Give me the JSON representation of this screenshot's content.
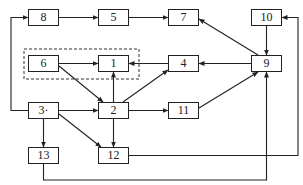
{
  "diagram": {
    "type": "directed-flow",
    "nodes": [
      {
        "id": "8",
        "label": "8",
        "x": 28,
        "y": 9,
        "w": 31,
        "h": 17
      },
      {
        "id": "5",
        "label": "5",
        "x": 98,
        "y": 9,
        "w": 31,
        "h": 17
      },
      {
        "id": "7",
        "label": "7",
        "x": 168,
        "y": 9,
        "w": 31,
        "h": 17
      },
      {
        "id": "10",
        "label": "10",
        "x": 251,
        "y": 9,
        "w": 31,
        "h": 17
      },
      {
        "id": "6",
        "label": "6",
        "x": 28,
        "y": 55,
        "w": 31,
        "h": 17
      },
      {
        "id": "1",
        "label": "1",
        "x": 98,
        "y": 55,
        "w": 31,
        "h": 17
      },
      {
        "id": "4",
        "label": "4",
        "x": 168,
        "y": 55,
        "w": 31,
        "h": 17
      },
      {
        "id": "9",
        "label": "9",
        "x": 251,
        "y": 55,
        "w": 31,
        "h": 17
      },
      {
        "id": "3",
        "label": "3·",
        "x": 28,
        "y": 102,
        "w": 31,
        "h": 17
      },
      {
        "id": "2",
        "label": "2",
        "x": 98,
        "y": 102,
        "w": 31,
        "h": 17
      },
      {
        "id": "11",
        "label": "11",
        "x": 168,
        "y": 102,
        "w": 31,
        "h": 17
      },
      {
        "id": "13",
        "label": "13",
        "x": 28,
        "y": 147,
        "w": 31,
        "h": 17
      },
      {
        "id": "12",
        "label": "12",
        "x": 98,
        "y": 147,
        "w": 31,
        "h": 17
      }
    ],
    "group": {
      "members": [
        "6",
        "1"
      ],
      "style": "dashed",
      "x": 24,
      "y": 49,
      "w": 115,
      "h": 30
    },
    "edges": [
      {
        "from": "8",
        "to": "5"
      },
      {
        "from": "5",
        "to": "7"
      },
      {
        "from": "6",
        "to": "1"
      },
      {
        "from": "6",
        "to": "2"
      },
      {
        "from": "2",
        "to": "1"
      },
      {
        "from": "4",
        "to": "1"
      },
      {
        "from": "2",
        "to": "4"
      },
      {
        "from": "9",
        "to": "4"
      },
      {
        "from": "9",
        "to": "7"
      },
      {
        "from": "10",
        "to": "9"
      },
      {
        "from": "3",
        "to": "2"
      },
      {
        "from": "3",
        "to": "8",
        "route": "left-loop"
      },
      {
        "from": "3",
        "to": "13"
      },
      {
        "from": "3",
        "to": "12"
      },
      {
        "from": "2",
        "to": "12"
      },
      {
        "from": "2",
        "to": "11"
      },
      {
        "from": "11",
        "to": "9"
      },
      {
        "from": "12",
        "to": "10",
        "route": "right-loop"
      },
      {
        "from": "13",
        "to": "9",
        "route": "bottom-loop"
      }
    ]
  }
}
